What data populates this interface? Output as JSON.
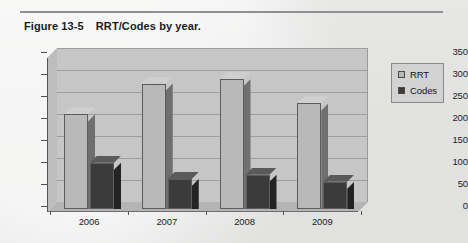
{
  "figure": {
    "label": "Figure 13-5",
    "title": "RRT/Codes by year."
  },
  "chart_data": {
    "type": "bar",
    "title": "RRT/Codes by year.",
    "xlabel": "",
    "ylabel": "",
    "ylim": [
      0,
      350
    ],
    "yticks": [
      "0",
      "50",
      "100",
      "150",
      "200",
      "250",
      "300",
      "350"
    ],
    "grid": true,
    "legend_position": "right",
    "categories": [
      "2006",
      "2007",
      "2008",
      "2009"
    ],
    "series": [
      {
        "name": "RRT",
        "color": "#b9b9b9",
        "values": [
          215,
          285,
          295,
          240
        ]
      },
      {
        "name": "Codes",
        "color": "#3b3b3b",
        "values": [
          105,
          68,
          78,
          62
        ]
      }
    ]
  },
  "legend": {
    "items": [
      {
        "label": "RRT"
      },
      {
        "label": "Codes"
      }
    ]
  }
}
